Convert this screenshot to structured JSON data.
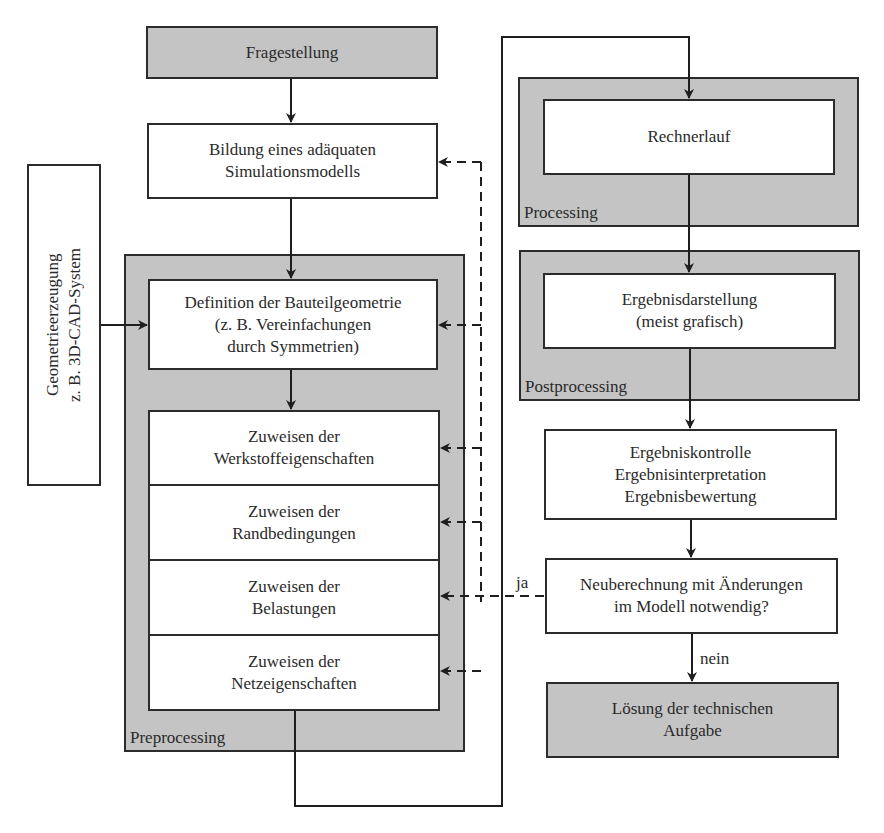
{
  "diagram": {
    "start": {
      "label": "Fragestellung"
    },
    "model": {
      "label": "Bildung eines adäquaten\nSimulationsmodells"
    },
    "geometry_source": {
      "label": "Geometrieerzeugung\nz. B. 3D-CAD-System"
    },
    "preprocessing": {
      "label": "Preprocessing",
      "steps": [
        {
          "label": "Definition der Bauteilgeometrie\n(z. B. Vereinfachungen\ndurch Symmetrien)"
        },
        {
          "label": "Zuweisen der\nWerkstoffeigenschaften"
        },
        {
          "label": "Zuweisen der\nRandbedingungen"
        },
        {
          "label": "Zuweisen der\nBelastungen"
        },
        {
          "label": "Zuweisen der\nNetzeigenschaften"
        }
      ]
    },
    "processing": {
      "label": "Processing",
      "step": {
        "label": "Rechnerlauf"
      }
    },
    "postprocessing": {
      "label": "Postprocessing",
      "step": {
        "label": "Ergebnisdarstellung\n(meist grafisch)"
      }
    },
    "evaluation": {
      "label": "Ergebniskontrolle\nErgebnisinterpretation\nErgebnisbewertung"
    },
    "decision": {
      "label": "Neuberechnung mit Änderungen\nim Modell notwendig?",
      "yes_label": "ja",
      "no_label": "nein"
    },
    "end": {
      "label": "Lösung der technischen\nAufgabe"
    }
  },
  "colors": {
    "box_fill": "#ffffff",
    "highlight_fill": "#c4c4c4",
    "stroke": "#2b2b2b"
  }
}
